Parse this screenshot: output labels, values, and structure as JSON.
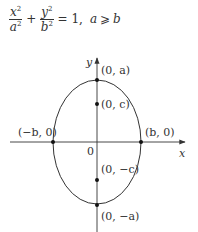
{
  "equation": {
    "term1": {
      "numerator": "x",
      "denominator": "a",
      "exponent": "2"
    },
    "term2": {
      "numerator": "y",
      "denominator": "b",
      "exponent": "2"
    },
    "plus": "+",
    "equals": "= 1,",
    "condition_var1": "a",
    "condition_op": "⩾",
    "condition_var2": "b"
  },
  "diagram": {
    "center": {
      "x": 97,
      "y": 142
    },
    "radius_x": 44,
    "radius_y": 62,
    "x_axis": {
      "from": 10,
      "to": 185,
      "y": 142,
      "label": "x"
    },
    "y_axis": {
      "from": 232,
      "to": 58,
      "x": 97,
      "label": "y"
    },
    "origin_label": "0",
    "points": [
      {
        "name": "vertex-top",
        "label": "(0, a)",
        "x": 97,
        "y": 80
      },
      {
        "name": "focus-top",
        "label": "(0, c)",
        "x": 97,
        "y": 104
      },
      {
        "name": "vertex-left",
        "label": "(−b, 0)",
        "x": 53,
        "y": 142
      },
      {
        "name": "vertex-right",
        "label": "(b, 0)",
        "x": 141,
        "y": 142
      },
      {
        "name": "focus-bottom",
        "label": "(0, −c)",
        "x": 97,
        "y": 180
      },
      {
        "name": "vertex-bottom",
        "label": "(0, −a)",
        "x": 97,
        "y": 205
      }
    ],
    "colors": {
      "stroke": "#333333",
      "point": "#111111",
      "background": "#ffffff"
    }
  }
}
